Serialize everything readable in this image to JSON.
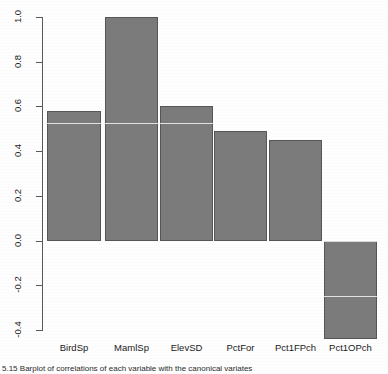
{
  "figure": {
    "caption": "5.15  Barplot of correlations of each variable with the canonical variates"
  },
  "chart_data": {
    "type": "bar",
    "title": "",
    "xlabel": "",
    "ylabel": "",
    "categories": [
      "BirdSp",
      "MamlSp",
      "ElevSD",
      "PctFor",
      "Pct1FPch",
      "Pct1OPch"
    ],
    "values": [
      0.58,
      1.0,
      0.6,
      0.49,
      0.45,
      -0.44
    ],
    "ylim": [
      -0.47,
      1.02
    ],
    "y_ticks": [
      1.0,
      0.8,
      0.6,
      0.4,
      0.2,
      0.0,
      -0.2,
      -0.4
    ],
    "y_tick_labels": [
      "1.0",
      "0.8",
      "0.6",
      "0.4",
      "0.2",
      "0.0",
      "-0.2",
      "-0.4"
    ],
    "grid": false,
    "legend": null,
    "bar_color": "#7b7b7b",
    "bar_border_color": "#565656",
    "axis_color": "#5a5a5a",
    "baseline": 0.0
  },
  "geometry": {
    "y_top_px": 17,
    "y_bottom_px": 331,
    "zero_px": 240.6,
    "px_per_unit": 223.6,
    "bars": [
      {
        "left": 47,
        "width": 54
      },
      {
        "left": 105,
        "width": 53
      },
      {
        "left": 160,
        "width": 53
      },
      {
        "left": 214,
        "width": 53
      },
      {
        "left": 269,
        "width": 53
      },
      {
        "left": 324,
        "width": 53
      }
    ],
    "scanlines": [
      123,
      240.5,
      296
    ]
  }
}
